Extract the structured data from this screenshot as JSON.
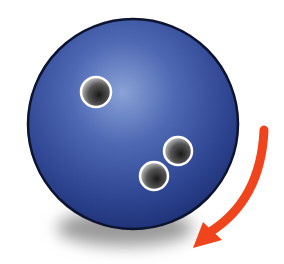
{
  "illustration": {
    "subject": "bowling-ball",
    "colors": {
      "ball_dark": "#1f3480",
      "ball_mid": "#34509e",
      "ball_highlight": "#8aa2d6",
      "outline": "#0d1430",
      "hole_ring": "#ffffff",
      "hole_dark": "#1a1a1a",
      "arrow": "#f0451c",
      "shadow": "#9a9a9a"
    },
    "ball": {
      "cx": 133,
      "cy": 124,
      "r": 105
    },
    "finger_holes": [
      {
        "cx": 96,
        "cy": 92,
        "r": 15
      },
      {
        "cx": 178,
        "cy": 151,
        "r": 14
      },
      {
        "cx": 154,
        "cy": 176,
        "r": 14
      }
    ],
    "arrow": {
      "direction": "clockwise-down-left"
    }
  }
}
